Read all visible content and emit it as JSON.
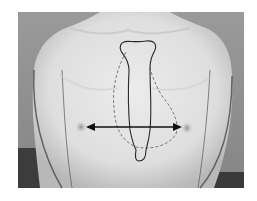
{
  "figure": {
    "annotations": {
      "sternum_outline": {
        "style": "solid",
        "color": "#2a2a2a"
      },
      "heart_outline": {
        "style": "dashed",
        "color": "#7a7a7a"
      },
      "intermammillary_arrow": {
        "style": "double-headed",
        "color": "#111111"
      }
    },
    "colors": {
      "background_wall": "#8f8f8f",
      "dark_floor": "#3c3c3c",
      "skin_light": "#e6e6e6",
      "skin_shade": "#bdbdbd",
      "nipple": "#9a9a9a"
    }
  }
}
